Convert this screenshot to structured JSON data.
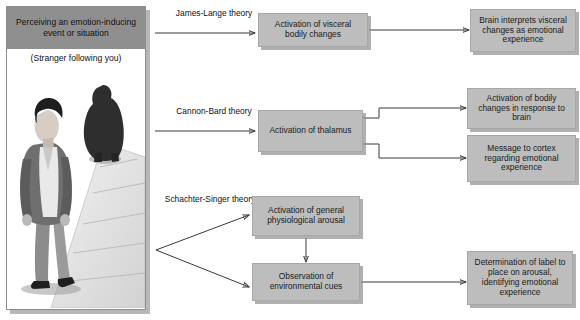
{
  "stimulus_panel": {
    "header": "Perceiving an emotion-inducing event or situation",
    "caption": "(Stranger following you)",
    "illustration": "person-walking-followed-by-shadowy-figure"
  },
  "theories": [
    {
      "id": "james-lange",
      "label_line1": "James-Lange",
      "label_line2": "theory"
    },
    {
      "id": "cannon-bard",
      "label_line1": "Cannon-Bard",
      "label_line2": "theory"
    },
    {
      "id": "schachter-singer",
      "label_line1": "Schachter-Singer",
      "label_line2": "theory"
    }
  ],
  "boxes": {
    "visceral_changes": "Activation of visceral bodily changes",
    "brain_interprets": "Brain interprets visceral changes as emotional experience",
    "thalamus": "Activation of thalamus",
    "bodily_response": "Activation of bodily changes in response to brain",
    "message_cortex": "Message to cortex regarding emotional experience",
    "physiological_arousal": "Activation of general physiological arousal",
    "environmental_cues": "Observation of environmental cues",
    "label_determination": "Determination of label to place on arousal, identifying emotional experience"
  },
  "colors": {
    "box_fill": "#bdbdbd",
    "header_fill": "#8f8f8f",
    "shadow": "#a5a5a5",
    "line": "#3a3a3a",
    "background": "#ffffff"
  }
}
